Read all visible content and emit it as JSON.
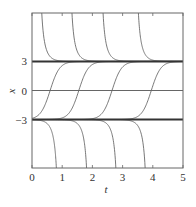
{
  "chart_data": {
    "type": "line",
    "title": "",
    "xlabel": "t",
    "ylabel": "x",
    "xlim": [
      0,
      5
    ],
    "ylim": [
      -8,
      8
    ],
    "xticks": [
      0,
      1,
      2,
      3,
      4,
      5
    ],
    "yticks": [
      -3,
      0,
      3
    ],
    "xtick_labels": [
      "0",
      "1",
      "2",
      "3",
      "4",
      "5"
    ],
    "ytick_labels": [
      "−3",
      "0",
      "3"
    ],
    "grid": false,
    "legend": null,
    "equilibria": [
      {
        "x": 3,
        "label": "3",
        "style": "thick"
      },
      {
        "x": 0,
        "label": "0",
        "style": "thin"
      },
      {
        "x": -3,
        "label": "−3",
        "style": "thick"
      }
    ],
    "series": [
      {
        "name": "above-3",
        "kind": "decay_from_infinity_to_3",
        "blowup_t": [
          0.2,
          1.2,
          2.23,
          3.4
        ]
      },
      {
        "name": "between",
        "kind": "s_curve_from_-3_to_3",
        "midpoint_t": [
          0.6,
          1.55,
          2.65,
          3.95
        ]
      },
      {
        "name": "below-3",
        "kind": "leave_-3_to_-infinity",
        "blowup_t": [
          0.93,
          1.93,
          2.9,
          3.87
        ]
      }
    ],
    "color": "#555555"
  }
}
